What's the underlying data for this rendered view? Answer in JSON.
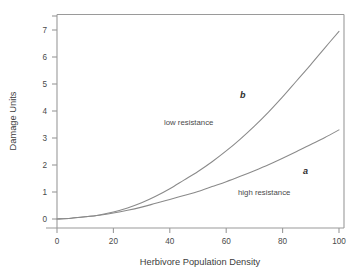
{
  "chart_data": {
    "type": "line",
    "title": "",
    "xlabel": "Herbivore Population Density",
    "ylabel": "Damage Units",
    "xlim": [
      0,
      105
    ],
    "ylim": [
      0,
      7.5
    ],
    "grid": false,
    "legend_position": "inline-annotations",
    "xticks": [
      0,
      20,
      40,
      60,
      80,
      100
    ],
    "xtick_labels": [
      "0",
      "20",
      "40",
      "60",
      "80",
      "100"
    ],
    "yticks": [
      0,
      1,
      2,
      3,
      4,
      5,
      6,
      7
    ],
    "ytick_labels": [
      "0",
      "1",
      "2",
      "3",
      "4",
      "5",
      "6",
      "7"
    ],
    "x": [
      0,
      5,
      10,
      15,
      20,
      25,
      30,
      35,
      40,
      45,
      50,
      55,
      60,
      65,
      70,
      75,
      80,
      85,
      90,
      95,
      100
    ],
    "series": [
      {
        "name": "b",
        "label": "low resistance",
        "color": "#8a8a8a",
        "values": [
          0.0,
          0.03,
          0.08,
          0.15,
          0.26,
          0.41,
          0.6,
          0.84,
          1.12,
          1.44,
          1.76,
          2.12,
          2.52,
          2.96,
          3.44,
          3.96,
          4.52,
          5.12,
          5.72,
          6.34,
          6.95
        ]
      },
      {
        "name": "a",
        "label": "high resistance",
        "color": "#8a8a8a",
        "values": [
          0.0,
          0.03,
          0.08,
          0.14,
          0.22,
          0.32,
          0.44,
          0.58,
          0.72,
          0.87,
          1.02,
          1.2,
          1.38,
          1.58,
          1.79,
          2.01,
          2.25,
          2.5,
          2.76,
          3.02,
          3.3
        ]
      }
    ],
    "annotations": [
      {
        "text": "b",
        "x": 66,
        "y": 4.4,
        "style": "italic-bold"
      },
      {
        "text": "low resistance",
        "x": 40,
        "y": 3.45,
        "style": "plain"
      },
      {
        "text": "a",
        "x": 89,
        "y": 1.75,
        "style": "italic-bold"
      },
      {
        "text": "high resistance",
        "x": 73,
        "y": 1.0,
        "style": "plain"
      }
    ]
  },
  "labels": {
    "xaxis_title": "Herbivore Population Density",
    "yaxis_title": "Damage Units",
    "curve_b": "b",
    "curve_a": "a",
    "region_low": "low resistance",
    "region_high": "high resistance",
    "x0": "0",
    "x20": "20",
    "x40": "40",
    "x60": "60",
    "x80": "80",
    "x100": "100",
    "y0": "0",
    "y1": "1",
    "y2": "2",
    "y3": "3",
    "y4": "4",
    "y5": "5",
    "y6": "6",
    "y7": "7"
  },
  "colors": {
    "axis": "#9a9a9a",
    "curve": "#8a8a8a",
    "text": "#3b3b3b",
    "background": "#ffffff"
  }
}
